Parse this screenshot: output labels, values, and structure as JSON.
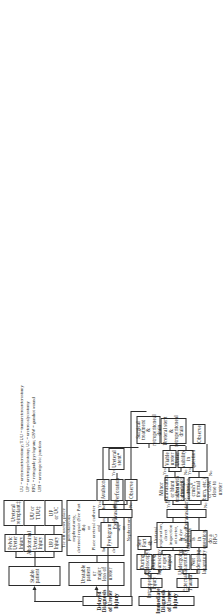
{
  "diagram": {
    "orientation": "rotated-90-ccw"
  },
  "nodes": {
    "stable_patient": "Stable patient",
    "unstable_patient": "Unstable patient or\nmajor loss of ureter",
    "upj_injury": "UPJ\nInjury",
    "abdominal_ureter_injury": "Abdominal\nUreter\nInjury",
    "pelvic_ureter_injury": "Pelvic\nUreter\nInjury",
    "up_or_uc": "UP\nor UC",
    "uu_or_tuu": "UU or\nTUU‡",
    "ureteral_reimplant": "Ureteral\nreimplant‡",
    "unstable_treatment": "Tie off ureter, place\npercutaneous nephrostomy,\ndeferred repair (See Part 4b)\nor\nPlace ureteral catheter and\nbring it out through the skin,\ndeferred repair (See Part 4b)\nor\nNephrectomy",
    "immediate_dx": "Immediate Diagnosis of Ureter Injury",
    "delayed_dx": "Delayed Diagnosis of Ureter Injury",
    "external_trauma": "External Trauma",
    "intraoperative_injury": "Intraoperative Injury",
    "not_undergoing_lap": "Not undergoing\nlaparotomy",
    "undergoing_lap": "Undergoing\nlaparotomy",
    "during_lap_open": "During laparoscopy\nor open surgery",
    "during_endoscopy": "During\nEndoscopy§",
    "see_part_4b": "See\nPart 4b",
    "if_dx_question_rpg": "If diagnosis is\nin question,\ndo a RPG",
    "ureteral_exploration": "Ureteral exploration,\ndirect inspection of ureter,\n& dye study of ureter†",
    "pyelogram": "Pyelogram",
    "extravasation_q1": "Extravasation?",
    "extravasation_q2": "Extravasation?",
    "ureter_damage": "Ureter damage (contusion,\ncrush°, thermal burn, etc.)\nor GSW close to ureter",
    "minor_extravasation": "Minor extravasation\nor blunt trauma with\npartial UPJ tear",
    "observe_1": "Observe",
    "observe_2": "Observe",
    "perforation": "Perforation",
    "avulsion": "Avulsion",
    "viable_ureter": "Viable\nureter",
    "ureter_viability_question": "Ureter viability\nin question",
    "ureteral_stent_retro_drain": "Ureteral stent &\nretroperitoneal drain",
    "ureteral_stent_star": "Ureteral stent*",
    "surgical_treatment_drain": "Surgical treatment\n& retroperitoneal drain"
  },
  "edge_labels": {
    "no_1": "No",
    "no_2": "No",
    "no_3": "No",
    "no_4": "No",
    "yes_1": "Yes",
    "yes_2": "Yes",
    "yes_3": "Yes",
    "yes_4": "Yes",
    "yes_5": "Yes"
  },
  "legend": [
    "UU = ureteroureterostomy; TUU = transureteroureterostomy",
    "UP = ureteropyelostomy; UC = ureterocalycostomy",
    "RPG = retrograde pyelogram; GSW = gunshot wound",
    "UPJ = ureteropelvic junction"
  ],
  "colors": {
    "stroke": "#2b2b2b",
    "background": "#ffffff",
    "text": "#1a1a1a"
  }
}
